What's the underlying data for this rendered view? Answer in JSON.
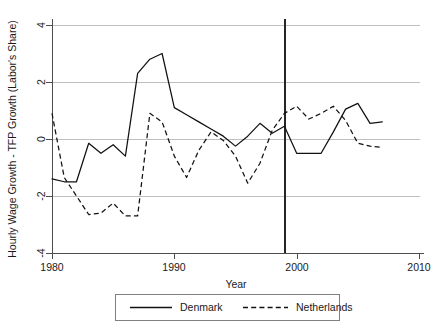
{
  "chart_data": {
    "type": "line",
    "title": "",
    "xlabel": "Year",
    "ylabel": "Hourly Wage Growth - TFP Growth (Labor's Share)",
    "xlim": [
      1980,
      2010
    ],
    "ylim": [
      -4,
      4
    ],
    "xticks": [
      1980,
      1990,
      2000,
      2010
    ],
    "xtick_labels": [
      "1980",
      "1990",
      "2000",
      "2010"
    ],
    "yticks": [
      -4,
      -2,
      0,
      2,
      4
    ],
    "ytick_labels": [
      "-4",
      "-2",
      "0",
      "2",
      "4"
    ],
    "grid": "horizontal",
    "legend_position": "below-axes",
    "annotations": [
      {
        "name": "euro-reference-vertical-line",
        "type": "vline",
        "x": 1999,
        "label": ""
      }
    ],
    "series": [
      {
        "name": "Denmark",
        "style": "solid",
        "x": [
          1980,
          1981,
          1982,
          1983,
          1984,
          1985,
          1986,
          1987,
          1988,
          1989,
          1990,
          1991,
          1992,
          1993,
          1994,
          1995,
          1996,
          1997,
          1998,
          1999,
          2000,
          2001,
          2002,
          2003,
          2004,
          2005,
          2006,
          2007
        ],
        "values": [
          -1.4,
          -1.5,
          -1.5,
          -0.15,
          -0.5,
          -0.2,
          -0.6,
          2.3,
          2.8,
          3.0,
          1.1,
          0.85,
          0.6,
          0.35,
          0.1,
          -0.25,
          0.1,
          0.55,
          0.2,
          0.45,
          -0.5,
          -0.5,
          -0.5,
          0.25,
          1.05,
          1.25,
          0.55,
          0.6
        ]
      },
      {
        "name": "Netherlands",
        "style": "dashed",
        "x": [
          1980,
          1981,
          1982,
          1983,
          1984,
          1985,
          1986,
          1987,
          1988,
          1989,
          1990,
          1991,
          1992,
          1993,
          1994,
          1995,
          1996,
          1997,
          1998,
          1999,
          2000,
          2001,
          2002,
          2003,
          2004,
          2005,
          2006,
          2007
        ],
        "values": [
          0.9,
          -1.35,
          -2.0,
          -2.65,
          -2.6,
          -2.25,
          -2.7,
          -2.7,
          0.9,
          0.6,
          -0.6,
          -1.35,
          -0.4,
          0.25,
          -0.05,
          -0.6,
          -1.55,
          -0.85,
          0.3,
          0.9,
          1.15,
          0.7,
          0.9,
          1.15,
          0.65,
          -0.15,
          -0.25,
          -0.3
        ]
      }
    ]
  },
  "legend": {
    "entries": [
      {
        "label": "Denmark",
        "style": "solid"
      },
      {
        "label": "Netherlands",
        "style": "dashed"
      }
    ]
  }
}
